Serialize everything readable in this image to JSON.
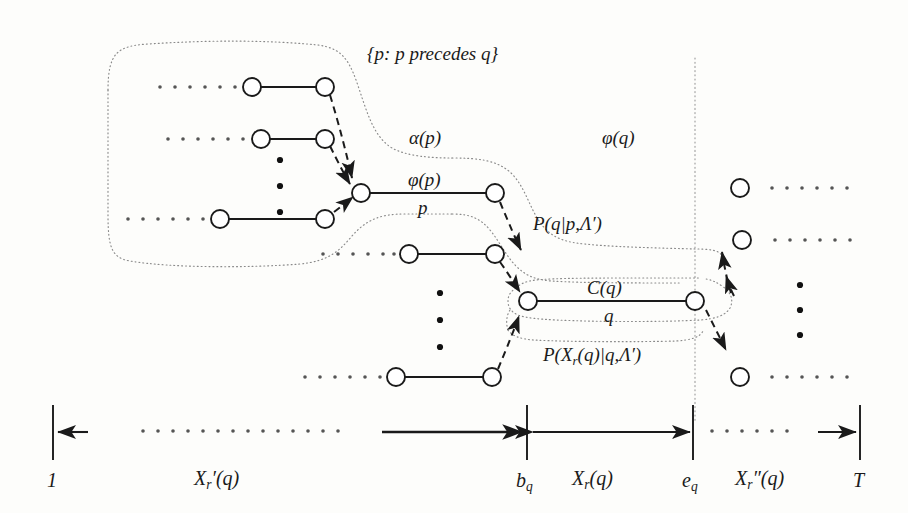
{
  "figure": {
    "title_set": "{p: p precedes q}",
    "labels": {
      "alpha_p": "α(p)",
      "phi_p": "φ(p)",
      "phi_q": "φ(q)",
      "p": "p",
      "q": "q",
      "C_q": "C(q)",
      "P_q_given_p": "P(q|p,Λ′)",
      "P_Xr_given_q": "P(X",
      "P_Xr_given_q_sub": "r",
      "P_Xr_given_q_tail": "(q)|q,Λ′)"
    },
    "axis": {
      "tick_start": "1",
      "tick_bq_main": "b",
      "tick_bq_sub": "q",
      "tick_eq_main": "e",
      "tick_eq_sub": "q",
      "tick_end": "T",
      "span_left_main": "X",
      "span_left_sub": "r",
      "span_left_tail": "′(q)",
      "span_mid_main": "X",
      "span_mid_sub": "r",
      "span_mid_tail": "(q)",
      "span_right_main": "X",
      "span_right_sub": "r",
      "span_right_tail": "″(q)"
    },
    "colors": {
      "stroke": "#1a1a1a",
      "dotted": "#8a8a8a",
      "node_fill": "#ffffff",
      "background": "#fdfdfb"
    },
    "geometry": {
      "node_radius": 9,
      "vertical_line_x": 695,
      "axis_y": 432,
      "ticks_x": [
        53,
        527,
        693,
        860
      ]
    },
    "nodes": [
      {
        "name": "p-set-row1-left",
        "x": 252,
        "y": 87
      },
      {
        "name": "p-set-row1-right",
        "x": 325,
        "y": 87
      },
      {
        "name": "p-set-row2-left",
        "x": 261,
        "y": 139
      },
      {
        "name": "p-set-row2-right",
        "x": 325,
        "y": 139
      },
      {
        "name": "p-set-row3-left",
        "x": 220,
        "y": 219
      },
      {
        "name": "p-set-row3-right",
        "x": 325,
        "y": 219
      },
      {
        "name": "p-left",
        "x": 361,
        "y": 193
      },
      {
        "name": "p-right",
        "x": 495,
        "y": 193
      },
      {
        "name": "q-pred-row-left",
        "x": 409,
        "y": 254
      },
      {
        "name": "q-pred-row-right",
        "x": 495,
        "y": 254
      },
      {
        "name": "q-left",
        "x": 528,
        "y": 301
      },
      {
        "name": "q-right",
        "x": 695,
        "y": 301
      },
      {
        "name": "q-lower-row-left",
        "x": 396,
        "y": 377
      },
      {
        "name": "q-lower-row-right",
        "x": 492,
        "y": 377
      },
      {
        "name": "succ-row1",
        "x": 740,
        "y": 188
      },
      {
        "name": "succ-row2",
        "x": 742,
        "y": 240
      },
      {
        "name": "succ-row3",
        "x": 740,
        "y": 377
      }
    ],
    "ellipsis_rows": [
      {
        "name": "ellipsis-p-row1",
        "x": 160,
        "y": 87,
        "count": 6
      },
      {
        "name": "ellipsis-p-row2",
        "x": 168,
        "y": 139,
        "count": 6
      },
      {
        "name": "ellipsis-p-row3",
        "x": 135,
        "y": 219,
        "count": 6
      },
      {
        "name": "ellipsis-q-row1",
        "x": 323,
        "y": 254,
        "count": 6
      },
      {
        "name": "ellipsis-q-row2",
        "x": 305,
        "y": 377,
        "count": 6
      },
      {
        "name": "ellipsis-succ1",
        "x": 772,
        "y": 188,
        "count": 6
      },
      {
        "name": "ellipsis-succ2",
        "x": 775,
        "y": 240,
        "count": 6
      },
      {
        "name": "ellipsis-succ3",
        "x": 772,
        "y": 377,
        "count": 6
      },
      {
        "name": "ellipsis-axis-left",
        "x": 143,
        "y": 431,
        "count": 14
      },
      {
        "name": "ellipsis-axis-right",
        "x": 710,
        "y": 431,
        "count": 6
      }
    ],
    "vertical_dots": [
      {
        "name": "vdots-p-set",
        "x": 280,
        "y": 160,
        "count": 3,
        "gap": 20
      },
      {
        "name": "vdots-q-group",
        "x": 440,
        "y": 290,
        "count": 3,
        "gap": 22
      },
      {
        "name": "vdots-succ",
        "x": 800,
        "y": 283,
        "count": 3,
        "gap": 24
      }
    ]
  }
}
